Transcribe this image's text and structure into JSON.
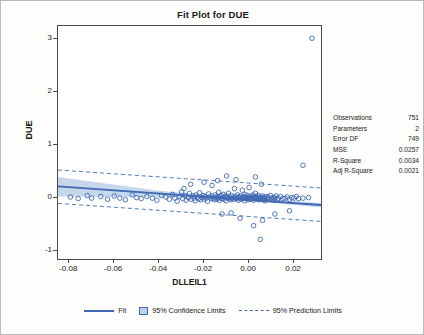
{
  "chart_title": "Fit Plot for DUE",
  "axes": {
    "ylabel": "DUE",
    "xlabel": "DLLEIL1",
    "yticks": [
      "3",
      "2",
      "1",
      "0",
      "-1"
    ],
    "ytick_values": [
      3,
      2,
      1,
      0,
      -1
    ],
    "xticks": [
      "-0.08",
      "-0.06",
      "-0.04",
      "-0.02",
      "0.00",
      "0.02"
    ],
    "xtick_values": [
      -0.08,
      -0.06,
      -0.04,
      -0.02,
      0.0,
      0.02
    ]
  },
  "stats": [
    {
      "label": "Observations",
      "value": "751"
    },
    {
      "label": "Parameters",
      "value": "2"
    },
    {
      "label": "Error DF",
      "value": "749"
    },
    {
      "label": "MSE",
      "value": "0.0257"
    },
    {
      "label": "R-Square",
      "value": "0.0034"
    },
    {
      "label": "Adj R-Square",
      "value": "0.0021"
    }
  ],
  "legend": [
    {
      "key": "fit",
      "label": "Fit",
      "swatch": "line"
    },
    {
      "key": "conf",
      "label": "95% Confidence Limits",
      "swatch": "band"
    },
    {
      "key": "pred",
      "label": "95% Prediction Limits",
      "swatch": "dash"
    }
  ],
  "colors": {
    "fit_line": "#4169b2",
    "confidence_band": "#bcd0e8",
    "prediction_line": "#4169b2",
    "marker_stroke": "#4169b2",
    "axis": "#4a4a4a",
    "text": "#1a1a1a",
    "background": "#fdfdfb"
  },
  "chart_data": {
    "type": "scatter",
    "title": "Fit Plot for DUE",
    "xlabel": "DLLEIL1",
    "ylabel": "DUE",
    "xlim": [
      -0.085,
      0.032
    ],
    "ylim": [
      -1.15,
      3.25
    ],
    "grid": false,
    "legend_position": "bottom",
    "fit": {
      "type": "line",
      "slope": -3.0,
      "intercept": -0.035,
      "endpoints": [
        [
          -0.085,
          0.22
        ],
        [
          0.032,
          -0.13
        ]
      ]
    },
    "confidence_band": {
      "level": 0.95,
      "upper": [
        [
          -0.085,
          0.4
        ],
        [
          -0.04,
          0.14
        ],
        [
          -0.005,
          0.02
        ],
        [
          0.032,
          -0.09
        ]
      ],
      "lower": [
        [
          -0.085,
          0.03
        ],
        [
          -0.04,
          0.02
        ],
        [
          -0.005,
          -0.03
        ],
        [
          0.032,
          -0.18
        ]
      ]
    },
    "prediction_band": {
      "level": 0.95,
      "upper": [
        [
          -0.085,
          0.53
        ],
        [
          0.032,
          0.19
        ]
      ],
      "lower": [
        [
          -0.085,
          -0.1
        ],
        [
          0.032,
          -0.44
        ]
      ]
    },
    "points": [
      [
        -0.0795,
        0.02
      ],
      [
        -0.076,
        -0.01
      ],
      [
        -0.072,
        0.05
      ],
      [
        -0.07,
        0.0
      ],
      [
        -0.066,
        0.03
      ],
      [
        -0.063,
        -0.02
      ],
      [
        -0.06,
        0.04
      ],
      [
        -0.0575,
        0.0
      ],
      [
        -0.055,
        -0.03
      ],
      [
        -0.052,
        0.06
      ],
      [
        -0.05,
        0.01
      ],
      [
        -0.048,
        -0.01
      ],
      [
        -0.0455,
        0.03
      ],
      [
        -0.043,
        0.0
      ],
      [
        -0.041,
        -0.04
      ],
      [
        -0.039,
        0.05
      ],
      [
        -0.037,
        0.02
      ],
      [
        -0.0355,
        -0.02
      ],
      [
        -0.034,
        0.07
      ],
      [
        -0.033,
        0.0
      ],
      [
        -0.032,
        -0.06
      ],
      [
        -0.031,
        0.03
      ],
      [
        -0.03,
        0.12
      ],
      [
        -0.0295,
        -0.01
      ],
      [
        -0.0285,
        0.05
      ],
      [
        -0.028,
        -0.04
      ],
      [
        -0.027,
        0.01
      ],
      [
        -0.0265,
        0.09
      ],
      [
        -0.0258,
        -0.02
      ],
      [
        -0.025,
        0.04
      ],
      [
        -0.0245,
        0.0
      ],
      [
        -0.024,
        -0.05
      ],
      [
        -0.0235,
        0.06
      ],
      [
        -0.023,
        0.02
      ],
      [
        -0.0225,
        -0.01
      ],
      [
        -0.022,
        0.1
      ],
      [
        -0.0215,
        -0.03
      ],
      [
        -0.021,
        0.01
      ],
      [
        -0.0205,
        0.05
      ],
      [
        -0.02,
        -0.02
      ],
      [
        -0.0195,
        0.03
      ],
      [
        -0.019,
        0.0
      ],
      [
        -0.0185,
        -0.06
      ],
      [
        -0.018,
        0.08
      ],
      [
        -0.0175,
        0.02
      ],
      [
        -0.017,
        -0.01
      ],
      [
        -0.0165,
        0.04
      ],
      [
        -0.016,
        0.0
      ],
      [
        -0.0155,
        -0.03
      ],
      [
        -0.015,
        0.06
      ],
      [
        -0.0148,
        0.01
      ],
      [
        -0.0145,
        -0.02
      ],
      [
        -0.0142,
        0.03
      ],
      [
        -0.0138,
        0.0
      ],
      [
        -0.0135,
        0.11
      ],
      [
        -0.0132,
        -0.04
      ],
      [
        -0.0128,
        0.02
      ],
      [
        -0.0125,
        0.05
      ],
      [
        -0.0122,
        -0.01
      ],
      [
        -0.0118,
        0.0
      ],
      [
        -0.0115,
        0.07
      ],
      [
        -0.0112,
        -0.02
      ],
      [
        -0.0108,
        0.03
      ],
      [
        -0.0105,
        0.01
      ],
      [
        -0.0102,
        -0.05
      ],
      [
        -0.0098,
        0.04
      ],
      [
        -0.0095,
        0.0
      ],
      [
        -0.0092,
        0.09
      ],
      [
        -0.0088,
        -0.01
      ],
      [
        -0.0085,
        0.02
      ],
      [
        -0.0082,
        -0.03
      ],
      [
        -0.0078,
        0.05
      ],
      [
        -0.0075,
        0.0
      ],
      [
        -0.0072,
        0.01
      ],
      [
        -0.0068,
        -0.02
      ],
      [
        -0.0065,
        0.18
      ],
      [
        -0.0062,
        0.03
      ],
      [
        -0.0058,
        -0.01
      ],
      [
        -0.0055,
        0.0
      ],
      [
        -0.0052,
        0.06
      ],
      [
        -0.0048,
        -0.04
      ],
      [
        -0.0045,
        0.02
      ],
      [
        -0.0042,
        0.0
      ],
      [
        -0.0038,
        0.04
      ],
      [
        -0.0035,
        -0.02
      ],
      [
        -0.0032,
        0.01
      ],
      [
        -0.003,
        0.15
      ],
      [
        -0.0028,
        -0.01
      ],
      [
        -0.0025,
        0.03
      ],
      [
        -0.0022,
        0.0
      ],
      [
        -0.002,
        -0.05
      ],
      [
        -0.0018,
        0.07
      ],
      [
        -0.0015,
        0.02
      ],
      [
        -0.0012,
        -0.01
      ],
      [
        -0.001,
        0.0
      ],
      [
        -0.0008,
        0.05
      ],
      [
        -0.0005,
        -0.03
      ],
      [
        -0.0002,
        0.01
      ],
      [
        0.0,
        0.2
      ],
      [
        0.0002,
        0.0
      ],
      [
        0.0005,
        -0.02
      ],
      [
        0.0008,
        0.04
      ],
      [
        0.001,
        0.01
      ],
      [
        0.0012,
        -0.01
      ],
      [
        0.0015,
        0.0
      ],
      [
        0.0018,
        0.06
      ],
      [
        0.002,
        -0.04
      ],
      [
        0.0022,
        0.02
      ],
      [
        0.0025,
        0.0
      ],
      [
        0.0028,
        0.09
      ],
      [
        0.003,
        -0.01
      ],
      [
        0.0032,
        0.03
      ],
      [
        0.0035,
        0.0
      ],
      [
        0.0038,
        -0.02
      ],
      [
        0.004,
        0.01
      ],
      [
        0.0042,
        0.05
      ],
      [
        0.0045,
        -0.03
      ],
      [
        0.0048,
        0.0
      ],
      [
        0.005,
        0.02
      ],
      [
        0.0052,
        -0.01
      ],
      [
        0.0055,
        0.26
      ],
      [
        0.0058,
        0.0
      ],
      [
        0.006,
        0.04
      ],
      [
        0.0062,
        -0.02
      ],
      [
        0.0065,
        0.01
      ],
      [
        0.0068,
        0.0
      ],
      [
        0.007,
        -0.05
      ],
      [
        0.0075,
        0.03
      ],
      [
        0.008,
        0.0
      ],
      [
        0.0085,
        0.02
      ],
      [
        0.009,
        -0.01
      ],
      [
        0.0095,
        0.05
      ],
      [
        0.01,
        0.0
      ],
      [
        0.0105,
        -0.03
      ],
      [
        0.011,
        0.01
      ],
      [
        0.0115,
        0.0
      ],
      [
        0.012,
        0.04
      ],
      [
        0.0125,
        -0.02
      ],
      [
        0.013,
        0.0
      ],
      [
        0.014,
        0.03
      ],
      [
        0.015,
        -0.01
      ],
      [
        0.016,
        0.0
      ],
      [
        0.017,
        0.02
      ],
      [
        0.018,
        -0.02
      ],
      [
        0.019,
        0.01
      ],
      [
        0.02,
        0.0
      ],
      [
        0.021,
        0.03
      ],
      [
        0.022,
        -0.01
      ],
      [
        0.024,
        0.0
      ],
      [
        0.0265,
        0.01
      ],
      [
        0.028,
        3.02
      ],
      [
        0.024,
        0.62
      ],
      [
        0.005,
        -0.78
      ],
      [
        0.002,
        -0.52
      ],
      [
        -0.004,
        -0.38
      ],
      [
        -0.012,
        -0.3
      ],
      [
        -0.02,
        0.3
      ],
      [
        -0.026,
        0.26
      ],
      [
        -0.014,
        0.33
      ],
      [
        0.006,
        -0.42
      ],
      [
        0.0115,
        -0.3
      ],
      [
        -0.0058,
        0.35
      ],
      [
        -0.008,
        -0.28
      ],
      [
        0.0028,
        0.4
      ],
      [
        -0.0165,
        0.24
      ],
      [
        -0.029,
        0.18
      ],
      [
        0.018,
        -0.24
      ],
      [
        -0.01,
        0.42
      ]
    ]
  }
}
